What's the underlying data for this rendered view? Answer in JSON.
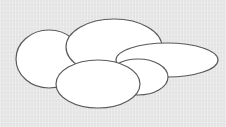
{
  "diagram": {
    "background": "#eaeaea",
    "stroke": "#5a5a5a",
    "fill": "#ffffff",
    "shapes": [
      {
        "id": "ellipse-left",
        "cx": 49,
        "cy": 59,
        "rx": 33,
        "ry": 29
      },
      {
        "id": "ellipse-top-center",
        "cx": 114,
        "cy": 47,
        "rx": 48,
        "ry": 28
      },
      {
        "id": "ellipse-right-flat",
        "cx": 167,
        "cy": 60,
        "rx": 51,
        "ry": 17
      },
      {
        "id": "ellipse-middle-right",
        "cx": 138,
        "cy": 77,
        "rx": 30,
        "ry": 18
      },
      {
        "id": "ellipse-bottom-front",
        "cx": 98,
        "cy": 84,
        "rx": 42,
        "ry": 24
      }
    ]
  }
}
